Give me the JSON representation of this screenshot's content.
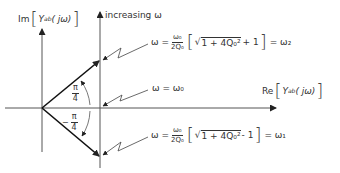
{
  "axes": {
    "imaginary_label_prefix": "Im",
    "imaginary_label_func": "Y",
    "imaginary_label_sub": "ab",
    "imaginary_label_arg": "( jω)",
    "real_label_prefix": "Re",
    "real_label_func": "Y",
    "real_label_sub": "ab",
    "real_label_arg": "( jω)"
  },
  "direction_label": "increasing ω",
  "angles": {
    "upper_num": "π",
    "upper_den": "4",
    "lower_sign": "−",
    "lower_num": "π",
    "lower_den": "4"
  },
  "equations": {
    "upper": {
      "lhs": "ω =",
      "frac_num": "ω₀",
      "frac_den": "2Q₀",
      "sqrt_body": "1 + 4Q₀²",
      "tail": "+ 1",
      "rhs": "= ω₂"
    },
    "middle": {
      "text": "ω = ω₀"
    },
    "lower": {
      "lhs": "ω =",
      "frac_num": "ω₀",
      "frac_den": "2Q₀",
      "sqrt_body": "1 + 4Q₀²",
      "tail": "- 1",
      "rhs": "= ω₁"
    }
  },
  "colors": {
    "line": "#333333",
    "background": "#ffffff"
  }
}
